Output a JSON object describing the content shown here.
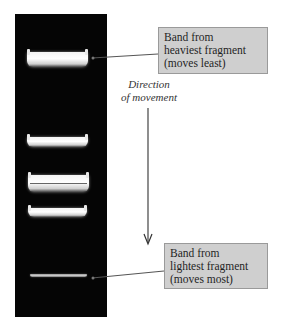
{
  "figure": {
    "colors": {
      "gel": "#050505",
      "band": "#ffffff",
      "callout_fill": "#cfcfcf",
      "callout_border": "#9a9a9a",
      "line": "#555555"
    }
  },
  "gel": {
    "bands": [
      {
        "label": "band-1",
        "y": 52,
        "height": 15,
        "intensity": "strong"
      },
      {
        "label": "band-2",
        "y": 137,
        "height": 10,
        "intensity": "strong"
      },
      {
        "label": "band-3a",
        "y": 175,
        "height": 9,
        "intensity": "strong"
      },
      {
        "label": "band-3b",
        "y": 184,
        "height": 8,
        "intensity": "strong"
      },
      {
        "label": "band-4",
        "y": 208,
        "height": 9,
        "intensity": "strong"
      },
      {
        "label": "band-5",
        "y": 274,
        "height": 4,
        "intensity": "faint"
      }
    ]
  },
  "callouts": {
    "heaviest": {
      "line1": "Band from",
      "line2": "heaviest fragment",
      "line3": "(moves least)"
    },
    "lightest": {
      "line1": "Band from",
      "line2": "lightest fragment",
      "line3": "(moves most)"
    }
  },
  "direction": {
    "line1": "Direction",
    "line2": "of movement"
  }
}
